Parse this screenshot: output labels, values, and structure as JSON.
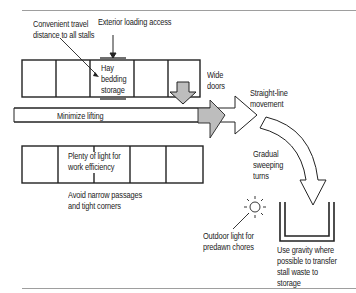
{
  "diagram": {
    "type": "barn-layout-principles",
    "colors": {
      "line": "#222222",
      "arrow_fill_gray": "#bdbdbd",
      "arrow_fill_white": "#ffffff",
      "rule_gray": "#9e9e9e"
    },
    "labels": {
      "travel_line1": "Convenient travel",
      "travel_line2": "distance to all stalls",
      "loading": "Exterior loading access",
      "hay_line1": "Hay",
      "hay_line2": "bedding",
      "hay_line3": "storage",
      "wide_doors_line1": "Wide",
      "wide_doors_line2": "doors",
      "straight_line1": "Straight-line",
      "straight_line2": "movement",
      "minimize": "Minimize lifting",
      "light_line1": "Plenty of light for",
      "light_line2": "work efficiency",
      "avoid_line1": "Avoid narrow passages",
      "avoid_line2": "and tight corners",
      "gradual_line1": "Gradual",
      "gradual_line2": "sweeping",
      "gradual_line3": "turns",
      "outdoor_line1": "Outdoor light for",
      "outdoor_line2": "predawn chores",
      "gravity_line1": "Use gravity where",
      "gravity_line2": "possible to transfer",
      "gravity_line3": "stall waste to",
      "gravity_line4": "storage"
    },
    "icons": [
      "sun-icon",
      "down-arrow-icon",
      "right-arrow-icon",
      "curved-arrow-icon",
      "manure-pit-icon"
    ]
  }
}
